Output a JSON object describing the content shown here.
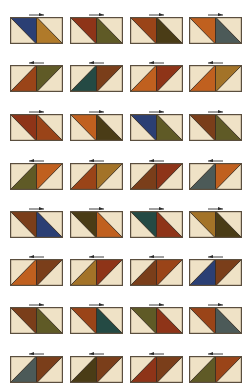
{
  "colors": {
    "light": "#efe2c6",
    "light_alt": "#f2e6cf",
    "border": "#5a4e3e",
    "seam": "#2a2018",
    "arrow": "#2a2a2a"
  },
  "fabrics": {
    "navy": "#2b3f74",
    "gold": "#b07a2a",
    "rust": "#a2421c",
    "olive": "#5f5a26",
    "teal": "#244a44",
    "brown": "#7a3e1a",
    "darkolive": "#4a3c16",
    "orange": "#c0601f",
    "slate": "#4c5a58",
    "redbrown": "#8e3418",
    "mustard": "#a37328",
    "plaidrust": "#9a4418"
  },
  "layout": {
    "columns_x": [
      10,
      70,
      130,
      189
    ],
    "rows_y": [
      17,
      65,
      114,
      163,
      211,
      259,
      307,
      356
    ],
    "block_w": 53,
    "block_h": 27
  },
  "rows": [
    {
      "direction": "right",
      "blocks": [
        [
          "navy",
          "gold"
        ],
        [
          "redbrown",
          "olive"
        ],
        [
          "plaidrust",
          "darkolive"
        ],
        [
          "orange",
          "slate"
        ]
      ]
    },
    {
      "direction": "left",
      "blocks": [
        [
          "plaidrust",
          "olive"
        ],
        [
          "teal",
          "brown"
        ],
        [
          "orange",
          "redbrown"
        ],
        [
          "orange",
          "mustard"
        ]
      ]
    },
    {
      "direction": "right",
      "blocks": [
        [
          "redbrown",
          "plaidrust"
        ],
        [
          "orange",
          "darkolive"
        ],
        [
          "navy",
          "olive"
        ],
        [
          "brown",
          "olive"
        ]
      ]
    },
    {
      "direction": "left",
      "blocks": [
        [
          "olive",
          "orange"
        ],
        [
          "plaidrust",
          "mustard"
        ],
        [
          "brown",
          "redbrown"
        ],
        [
          "slate",
          "orange"
        ]
      ]
    },
    {
      "direction": "right",
      "blocks": [
        [
          "brown",
          "navy"
        ],
        [
          "darkolive",
          "orange"
        ],
        [
          "teal",
          "redbrown"
        ],
        [
          "mustard",
          "darkolive"
        ]
      ]
    },
    {
      "direction": "left",
      "blocks": [
        [
          "orange",
          "brown"
        ],
        [
          "mustard",
          "redbrown"
        ],
        [
          "brown",
          "plaidrust"
        ],
        [
          "navy",
          "brown"
        ]
      ]
    },
    {
      "direction": "right",
      "blocks": [
        [
          "brown",
          "olive"
        ],
        [
          "plaidrust",
          "teal"
        ],
        [
          "olive",
          "redbrown"
        ],
        [
          "plaidrust",
          "slate"
        ]
      ]
    },
    {
      "direction": "left",
      "blocks": [
        [
          "slate",
          "brown"
        ],
        [
          "darkolive",
          "brown"
        ],
        [
          "redbrown",
          "brown"
        ],
        [
          "olive",
          "plaidrust"
        ]
      ]
    }
  ]
}
